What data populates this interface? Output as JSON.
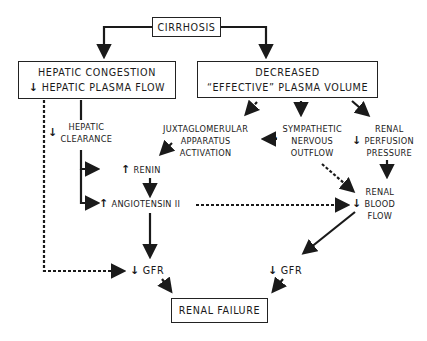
{
  "nodes": {
    "cirrhosis": {
      "label": "CIRRHOSIS"
    },
    "hepatic_congestion": {
      "line1": "HEPATIC  CONGESTION",
      "line2_arrow": "↓",
      "line2": "HEPATIC  PLASMA  FLOW"
    },
    "decreased_volume": {
      "line1": "DECREASED",
      "line2": "“EFFECTIVE”  PLASMA  VOLUME"
    },
    "hepatic_clearance": {
      "arrow": "↓",
      "line1": "HEPATIC",
      "line2": "CLEARANCE"
    },
    "jga": {
      "line1": "JUXTAGLOMERULAR",
      "line2": "APPARATUS",
      "line3": "ACTIVATION"
    },
    "sympathetic": {
      "arrow": "↑",
      "line1": "SYMPATHETIC",
      "line2": "NERVOUS",
      "line3": "OUTFLOW"
    },
    "renal_perfusion": {
      "arrow": "↓",
      "line1": "RENAL",
      "line2": "PERFUSION",
      "line3": "PRESSURE"
    },
    "renin": {
      "arrow": "↑",
      "label": "RENIN"
    },
    "angiotensin": {
      "arrow": "↑",
      "label": "ANGIOTENSIN  II"
    },
    "renal_blood_flow": {
      "arrow": "↓",
      "line1": "RENAL",
      "line2": "BLOOD",
      "line3": "FLOW"
    },
    "gfr_left": {
      "arrow": "↓",
      "label": "GFR"
    },
    "gfr_right": {
      "arrow": "↓",
      "label": "GFR"
    },
    "renal_failure": {
      "label": "RENAL  FAILURE"
    }
  },
  "colors": {
    "ink": "#1a1a1a",
    "background": "#ffffff"
  }
}
